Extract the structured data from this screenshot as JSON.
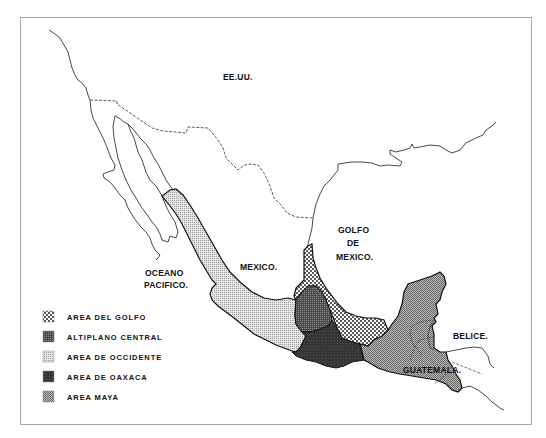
{
  "map": {
    "labels": {
      "usa": "EE.UU.",
      "mexico": "MEXICO.",
      "ocean_line1": "OCEANO",
      "ocean_line2": "PACIFICO.",
      "gulf_line1": "GOLFO",
      "gulf_line2": "DE",
      "gulf_line3": "MEXICO.",
      "belize": "BELICE.",
      "guatemala": "GUATEMALA."
    },
    "colors": {
      "frame": "#a8a8a8",
      "line": "#222222",
      "gulf_dots": "#111111",
      "altiplano": "#555555",
      "occidente": "#d8d8d8",
      "oaxaca": "#3a3a3a",
      "maya": "#9a9a9a"
    }
  },
  "legend": {
    "items": [
      {
        "id": "golfo",
        "label": "AREA DEL GOLFO",
        "pattern": "dots-coarse"
      },
      {
        "id": "altiplano",
        "label": "ALTIPLANO CENTRAL",
        "pattern": "dots-dense-dark"
      },
      {
        "id": "occidente",
        "label": "AREA DE OCCIDENTE",
        "pattern": "dots-fine-light"
      },
      {
        "id": "oaxaca",
        "label": "AREA DE OAXACA",
        "pattern": "solid-dark"
      },
      {
        "id": "maya",
        "label": "AREA MAYA",
        "pattern": "dots-medium-gray"
      }
    ]
  }
}
